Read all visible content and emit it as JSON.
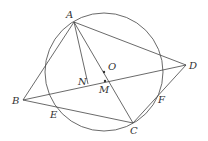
{
  "diagram": {
    "circle": {
      "cx": 104,
      "cy": 72,
      "r": 59,
      "label": "O"
    },
    "points": {
      "A": {
        "x": 74,
        "y": 22,
        "label": "A"
      },
      "B": {
        "x": 23,
        "y": 100,
        "label": "B"
      },
      "C": {
        "x": 133,
        "y": 123,
        "label": "C"
      },
      "D": {
        "x": 186,
        "y": 65,
        "label": "D"
      },
      "E": {
        "x": 55,
        "y": 106,
        "label": "E"
      },
      "F": {
        "x": 156,
        "y": 92,
        "label": "F"
      },
      "N": {
        "x": 88,
        "y": 83,
        "label": "N"
      },
      "M": {
        "x": 105,
        "y": 81,
        "label": "M"
      },
      "O": {
        "x": 104,
        "y": 72,
        "label": "O"
      }
    },
    "segments": [
      "AB",
      "AD",
      "AC",
      "AN",
      "BD",
      "BC",
      "CD"
    ],
    "stroke_color": "#444444"
  }
}
